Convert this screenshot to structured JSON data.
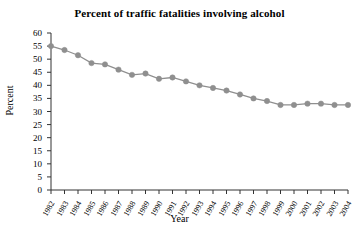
{
  "chart_data": {
    "type": "line",
    "title": "Percent of traffic fatalities involving alcohol",
    "xlabel": "Year",
    "ylabel": "Percent",
    "grid": false,
    "legend": "none",
    "marker": "circle",
    "line_color": "#8f8f8f",
    "marker_color": "#8f8f8f",
    "axis_color": "#333333",
    "ylim": [
      0,
      60
    ],
    "ytick_step": 5,
    "ytick_labels": [
      "0",
      "5",
      "10",
      "15",
      "20",
      "25",
      "30",
      "35",
      "40",
      "45",
      "50",
      "55",
      "60"
    ],
    "categories": [
      "1982",
      "1983",
      "1984",
      "1985",
      "1986",
      "1987",
      "1988",
      "1989",
      "1990",
      "1991",
      "1992",
      "1993",
      "1994",
      "1995",
      "1996",
      "1997",
      "1998",
      "1999",
      "2000",
      "2001",
      "2002",
      "2003",
      "2004"
    ],
    "values": [
      55,
      53.5,
      51.5,
      48.5,
      48,
      46,
      44,
      44.5,
      42.5,
      43,
      41.5,
      40,
      39,
      38,
      36.5,
      35,
      34,
      32.5,
      32.5,
      33,
      33,
      32.5,
      32.5
    ]
  }
}
